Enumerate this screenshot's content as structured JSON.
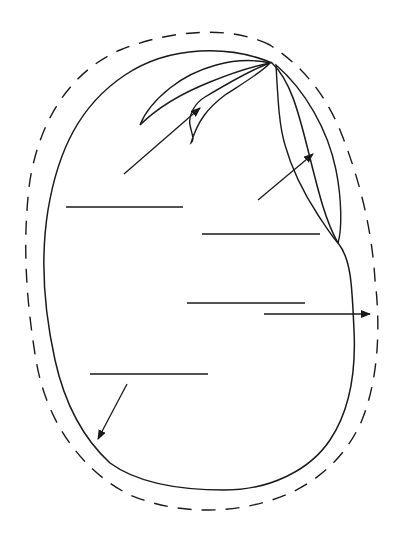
{
  "diagram": {
    "title": "",
    "stroke_color": "#1a1a1a",
    "background": "#ffffff",
    "parts": [
      {
        "id": "plumule",
        "label": ""
      },
      {
        "id": "radicle-hypocotyl",
        "label": ""
      },
      {
        "id": "cotyledon",
        "label": ""
      },
      {
        "id": "seed-coat",
        "label": ""
      },
      {
        "id": "embryo",
        "label": ""
      }
    ],
    "label_lines": [
      {
        "x1": 66,
        "y1": 207,
        "x2": 183,
        "y2": 207,
        "label": ""
      },
      {
        "x1": 202,
        "y1": 234,
        "x2": 320,
        "y2": 234,
        "label": ""
      },
      {
        "x1": 187,
        "y1": 303,
        "x2": 305,
        "y2": 303,
        "label": ""
      },
      {
        "x1": 90,
        "y1": 374,
        "x2": 208,
        "y2": 374,
        "label": ""
      }
    ],
    "arrows": [
      {
        "name": "arrow-to-plumule",
        "x1": 124,
        "y1": 174,
        "x2": 200,
        "y2": 108
      },
      {
        "name": "arrow-to-radicle",
        "x1": 258,
        "y1": 200,
        "x2": 313,
        "y2": 154
      },
      {
        "name": "arrow-to-seed-coat",
        "x1": 264,
        "y1": 314,
        "x2": 370,
        "y2": 314
      },
      {
        "name": "arrow-to-inner-edge",
        "x1": 127,
        "y1": 384,
        "x2": 98,
        "y2": 439
      }
    ]
  }
}
